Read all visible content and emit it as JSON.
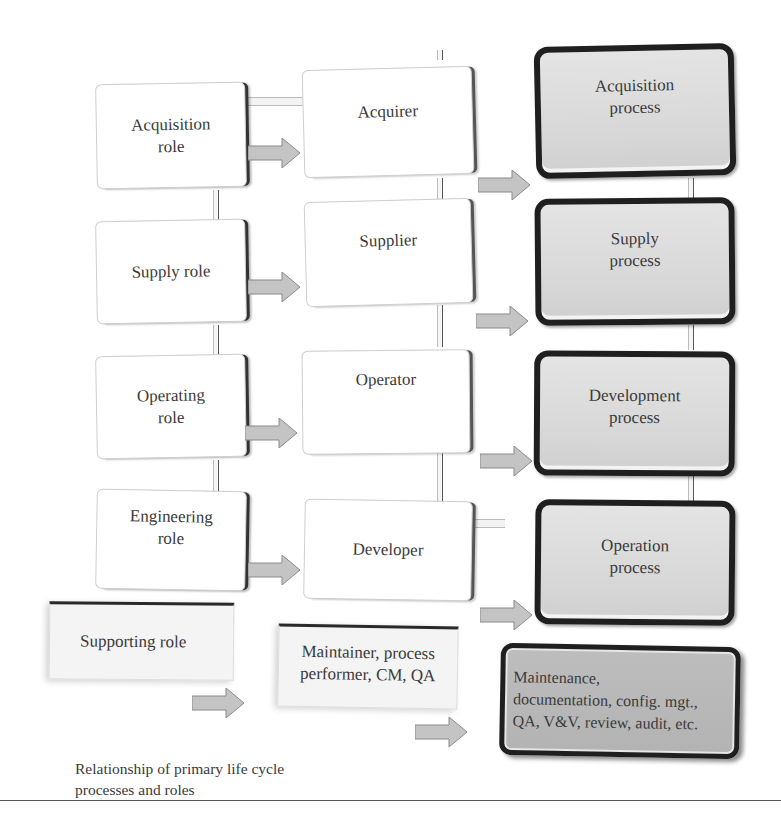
{
  "diagram": {
    "roles": [
      {
        "label": "Acquisition\nrole"
      },
      {
        "label": "Supply role"
      },
      {
        "label": "Operating\nrole"
      },
      {
        "label": "Engineering\nrole"
      },
      {
        "label": "Supporting role"
      }
    ],
    "actors": [
      {
        "label": "Acquirer"
      },
      {
        "label": "Supplier"
      },
      {
        "label": "Operator"
      },
      {
        "label": "Developer"
      },
      {
        "label": "Maintainer, process\nperformer, CM, QA"
      }
    ],
    "processes": [
      {
        "label": "Acquisition\nprocess"
      },
      {
        "label": "Supply\nprocess"
      },
      {
        "label": "Development\nprocess"
      },
      {
        "label": "Operation\nprocess"
      },
      {
        "label": "Maintenance,\ndocumentation, config. mgt.,\nQA, V&V, review, audit, etc."
      }
    ],
    "caption": "Relationship of primary life cycle\nprocesses and roles",
    "colors": {
      "arrow_fill": "#c4c4c4",
      "arrow_stroke": "#8a8a8a",
      "process_border": "#1f1f1f",
      "process_fill": "#dadada",
      "support_process_fill": "#b8b8b8"
    }
  }
}
